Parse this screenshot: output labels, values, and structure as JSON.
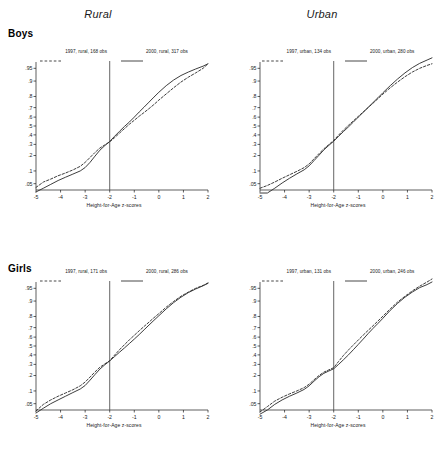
{
  "figure": {
    "column_titles": [
      "Rural",
      "Urban"
    ],
    "row_titles": [
      "Boys",
      "Girls"
    ]
  },
  "axis": {
    "xlabel": "Height-for-Age z-scores",
    "xticks": [
      "-5",
      "-4",
      "-3",
      "-2",
      "-1",
      "0",
      "1",
      "2"
    ],
    "yticks": [
      ".05",
      ".1",
      ".2",
      ".3",
      ".4",
      ".5",
      ".6",
      ".7",
      ".8",
      ".9",
      ".95"
    ],
    "reference_line_x": -2
  },
  "colors": {
    "line": "#333333",
    "reference": "#555555",
    "axis": "#1a1a1a",
    "background": "#ffffff"
  },
  "chart_data": [
    {
      "type": "line",
      "title": "Rural",
      "panel": "Boys",
      "xlabel": "Height-for-Age z-scores",
      "ylabel": "",
      "xlim": [
        -5,
        2
      ],
      "ylim": [
        0.02,
        0.98
      ],
      "grid": false,
      "legend_position": "top",
      "annotations": [
        {
          "type": "vline",
          "x": -2
        }
      ],
      "yscale": "normal-probability",
      "ytick_values": [
        0.05,
        0.1,
        0.2,
        0.3,
        0.4,
        0.5,
        0.6,
        0.7,
        0.8,
        0.9,
        0.95
      ],
      "series": [
        {
          "name": "1997, rural, 168 obs",
          "style": "dashed",
          "x": [
            -5.0,
            -4.7,
            -4.4,
            -4.1,
            -3.8,
            -3.5,
            -3.2,
            -3.0,
            -2.8,
            -2.6,
            -2.4,
            -2.2,
            -2.0,
            -1.8,
            -1.6,
            -1.4,
            -1.2,
            -1.0,
            -0.8,
            -0.6,
            -0.4,
            -0.2,
            0.0,
            0.3,
            0.6,
            0.9,
            1.2,
            1.5,
            1.8,
            2.0
          ],
          "y": [
            0.04,
            0.055,
            0.065,
            0.078,
            0.09,
            0.105,
            0.125,
            0.15,
            0.185,
            0.225,
            0.265,
            0.295,
            0.325,
            0.37,
            0.42,
            0.47,
            0.52,
            0.565,
            0.61,
            0.65,
            0.69,
            0.73,
            0.77,
            0.82,
            0.862,
            0.895,
            0.918,
            0.935,
            0.95,
            0.962
          ]
        },
        {
          "name": "2000, rural, 317 obs",
          "style": "solid",
          "x": [
            -5.0,
            -4.7,
            -4.4,
            -4.1,
            -3.8,
            -3.5,
            -3.2,
            -3.0,
            -2.8,
            -2.6,
            -2.4,
            -2.2,
            -2.0,
            -1.8,
            -1.6,
            -1.4,
            -1.2,
            -1.0,
            -0.8,
            -0.6,
            -0.4,
            -0.2,
            0.0,
            0.3,
            0.6,
            0.9,
            1.2,
            1.5,
            1.8,
            2.0
          ],
          "y": [
            0.03,
            0.038,
            0.048,
            0.06,
            0.072,
            0.085,
            0.1,
            0.118,
            0.15,
            0.195,
            0.245,
            0.288,
            0.33,
            0.385,
            0.44,
            0.495,
            0.545,
            0.6,
            0.655,
            0.705,
            0.752,
            0.795,
            0.832,
            0.875,
            0.905,
            0.925,
            0.938,
            0.948,
            0.956,
            0.962
          ]
        }
      ]
    },
    {
      "type": "line",
      "title": "Urban",
      "panel": "Boys",
      "xlabel": "Height-for-Age z-scores",
      "ylabel": "",
      "xlim": [
        -5,
        2
      ],
      "ylim": [
        0.02,
        0.98
      ],
      "grid": false,
      "legend_position": "top",
      "annotations": [
        {
          "type": "vline",
          "x": -2
        }
      ],
      "yscale": "normal-probability",
      "ytick_values": [
        0.05,
        0.1,
        0.2,
        0.3,
        0.4,
        0.5,
        0.6,
        0.7,
        0.8,
        0.9,
        0.95
      ],
      "series": [
        {
          "name": "1997, urban, 134 obs",
          "style": "dashed",
          "x": [
            -5.0,
            -4.7,
            -4.4,
            -4.1,
            -3.8,
            -3.5,
            -3.2,
            -3.0,
            -2.8,
            -2.6,
            -2.4,
            -2.2,
            -2.0,
            -1.8,
            -1.6,
            -1.4,
            -1.2,
            -1.0,
            -0.8,
            -0.6,
            -0.4,
            -0.2,
            0.0,
            0.3,
            0.6,
            0.9,
            1.2,
            1.5,
            1.8,
            2.0
          ],
          "y": [
            0.038,
            0.045,
            0.055,
            0.068,
            0.082,
            0.098,
            0.118,
            0.14,
            0.175,
            0.215,
            0.258,
            0.298,
            0.34,
            0.398,
            0.455,
            0.508,
            0.558,
            0.608,
            0.655,
            0.7,
            0.742,
            0.782,
            0.818,
            0.862,
            0.895,
            0.92,
            0.938,
            0.95,
            0.958,
            0.962
          ]
        },
        {
          "name": "2000, urban, 280 obs",
          "style": "solid",
          "x": [
            -5.0,
            -4.7,
            -4.4,
            -4.1,
            -3.8,
            -3.5,
            -3.2,
            -3.0,
            -2.8,
            -2.6,
            -2.4,
            -2.2,
            -2.0,
            -1.8,
            -1.6,
            -1.4,
            -1.2,
            -1.0,
            -0.8,
            -0.6,
            -0.4,
            -0.2,
            0.0,
            0.3,
            0.6,
            0.9,
            1.2,
            1.5,
            1.8,
            2.0
          ],
          "y": [
            0.028,
            0.028,
            0.038,
            0.052,
            0.068,
            0.086,
            0.106,
            0.128,
            0.162,
            0.202,
            0.248,
            0.29,
            0.332,
            0.385,
            0.438,
            0.49,
            0.545,
            0.6,
            0.652,
            0.702,
            0.748,
            0.79,
            0.828,
            0.875,
            0.91,
            0.935,
            0.952,
            0.963,
            0.97,
            0.974
          ]
        }
      ]
    },
    {
      "type": "line",
      "title": "Rural",
      "panel": "Girls",
      "xlabel": "Height-for-Age z-scores",
      "ylabel": "",
      "xlim": [
        -5,
        2
      ],
      "ylim": [
        0.02,
        0.98
      ],
      "grid": false,
      "legend_position": "top",
      "annotations": [
        {
          "type": "vline",
          "x": -2
        }
      ],
      "yscale": "normal-probability",
      "ytick_values": [
        0.05,
        0.1,
        0.2,
        0.3,
        0.4,
        0.5,
        0.6,
        0.7,
        0.8,
        0.9,
        0.95
      ],
      "series": [
        {
          "name": "1997, rural, 171 obs",
          "style": "dashed",
          "x": [
            -5.0,
            -4.7,
            -4.4,
            -4.1,
            -3.8,
            -3.5,
            -3.2,
            -3.0,
            -2.8,
            -2.6,
            -2.4,
            -2.2,
            -2.0,
            -1.8,
            -1.6,
            -1.4,
            -1.2,
            -1.0,
            -0.8,
            -0.6,
            -0.4,
            -0.2,
            0.0,
            0.3,
            0.6,
            0.9,
            1.2,
            1.5,
            1.8,
            2.0
          ],
          "y": [
            0.032,
            0.048,
            0.062,
            0.076,
            0.09,
            0.106,
            0.128,
            0.152,
            0.188,
            0.23,
            0.272,
            0.305,
            0.338,
            0.398,
            0.458,
            0.515,
            0.57,
            0.62,
            0.668,
            0.712,
            0.752,
            0.79,
            0.822,
            0.866,
            0.898,
            0.922,
            0.938,
            0.95,
            0.958,
            0.964
          ]
        },
        {
          "name": "2000, rural, 286 obs",
          "style": "solid",
          "x": [
            -5.0,
            -4.7,
            -4.4,
            -4.1,
            -3.8,
            -3.5,
            -3.2,
            -3.0,
            -2.8,
            -2.6,
            -2.4,
            -2.2,
            -2.0,
            -1.8,
            -1.6,
            -1.4,
            -1.2,
            -1.0,
            -0.8,
            -0.6,
            -0.4,
            -0.2,
            0.0,
            0.3,
            0.6,
            0.9,
            1.2,
            1.5,
            1.8,
            2.0
          ],
          "y": [
            0.028,
            0.038,
            0.05,
            0.062,
            0.076,
            0.092,
            0.11,
            0.13,
            0.165,
            0.208,
            0.255,
            0.296,
            0.335,
            0.382,
            0.43,
            0.478,
            0.528,
            0.578,
            0.628,
            0.678,
            0.725,
            0.768,
            0.806,
            0.855,
            0.892,
            0.918,
            0.936,
            0.948,
            0.957,
            0.963
          ]
        }
      ]
    },
    {
      "type": "line",
      "title": "Urban",
      "panel": "Girls",
      "xlabel": "Height-for-Age z-scores",
      "ylabel": "",
      "xlim": [
        -5,
        2
      ],
      "ylim": [
        0.02,
        0.98
      ],
      "grid": false,
      "legend_position": "top",
      "annotations": [
        {
          "type": "vline",
          "x": -2
        }
      ],
      "yscale": "normal-probability",
      "ytick_values": [
        0.05,
        0.1,
        0.2,
        0.3,
        0.4,
        0.5,
        0.6,
        0.7,
        0.8,
        0.9,
        0.95
      ],
      "series": [
        {
          "name": "1997, urban, 131 obs",
          "style": "dashed",
          "x": [
            -5.0,
            -4.7,
            -4.4,
            -4.1,
            -3.8,
            -3.5,
            -3.2,
            -3.0,
            -2.8,
            -2.6,
            -2.4,
            -2.2,
            -2.0,
            -1.8,
            -1.6,
            -1.4,
            -1.2,
            -1.0,
            -0.8,
            -0.6,
            -0.4,
            -0.2,
            0.0,
            0.3,
            0.6,
            0.9,
            1.2,
            1.5,
            1.8,
            2.0
          ],
          "y": [
            0.03,
            0.042,
            0.058,
            0.072,
            0.086,
            0.1,
            0.118,
            0.138,
            0.168,
            0.2,
            0.228,
            0.248,
            0.268,
            0.33,
            0.395,
            0.455,
            0.512,
            0.568,
            0.622,
            0.672,
            0.718,
            0.762,
            0.802,
            0.855,
            0.895,
            0.922,
            0.942,
            0.956,
            0.966,
            0.972
          ]
        },
        {
          "name": "2000, urban, 246 obs",
          "style": "solid",
          "x": [
            -5.0,
            -4.7,
            -4.4,
            -4.1,
            -3.8,
            -3.5,
            -3.2,
            -3.0,
            -2.8,
            -2.6,
            -2.4,
            -2.2,
            -2.0,
            -1.8,
            -1.6,
            -1.4,
            -1.2,
            -1.0,
            -0.8,
            -0.6,
            -0.4,
            -0.2,
            0.0,
            0.3,
            0.6,
            0.9,
            1.2,
            1.5,
            1.8,
            2.0
          ],
          "y": [
            0.026,
            0.034,
            0.048,
            0.062,
            0.076,
            0.09,
            0.108,
            0.128,
            0.158,
            0.19,
            0.218,
            0.238,
            0.258,
            0.3,
            0.348,
            0.4,
            0.458,
            0.518,
            0.578,
            0.638,
            0.692,
            0.74,
            0.785,
            0.845,
            0.888,
            0.918,
            0.938,
            0.952,
            0.96,
            0.966
          ]
        }
      ]
    }
  ]
}
